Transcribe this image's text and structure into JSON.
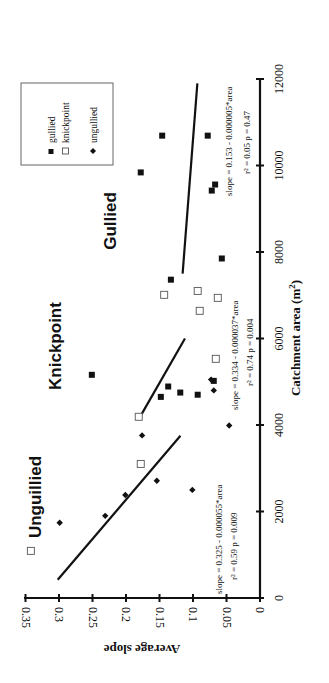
{
  "chart_data": {
    "type": "scatter",
    "orientation": "rotated 90 degrees counter-clockwise",
    "title": "",
    "xlabel": "Catchment area (m2)",
    "ylabel": "Average slope",
    "xlim": [
      0,
      12000
    ],
    "ylim": [
      0,
      0.35
    ],
    "x_ticks": [
      0,
      2000,
      4000,
      6000,
      8000,
      10000,
      12000
    ],
    "y_ticks": [
      0,
      0.05,
      0.1,
      0.15,
      0.2,
      0.25,
      0.3,
      0.35
    ],
    "y_tick_labels": [
      "0",
      "0.05",
      "0.1",
      "0.15",
      "0.2",
      "0.25",
      "0.3",
      "0.35"
    ],
    "grid": false,
    "legend_position": "upper left (top of rotated image)",
    "series": [
      {
        "name": "gullied",
        "marker": "filled-square",
        "points": [
          {
            "x": 10690,
            "y": 0.146
          },
          {
            "x": 10690,
            "y": 0.078
          },
          {
            "x": 9840,
            "y": 0.178
          },
          {
            "x": 9560,
            "y": 0.067
          },
          {
            "x": 9420,
            "y": 0.072
          },
          {
            "x": 7850,
            "y": 0.057
          },
          {
            "x": 7360,
            "y": 0.133
          },
          {
            "x": 5160,
            "y": 0.251
          },
          {
            "x": 5020,
            "y": 0.069
          },
          {
            "x": 4890,
            "y": 0.137
          },
          {
            "x": 4750,
            "y": 0.119
          },
          {
            "x": 4700,
            "y": 0.093
          },
          {
            "x": 4650,
            "y": 0.148
          }
        ]
      },
      {
        "name": "knickpoint",
        "marker": "open-square",
        "points": [
          {
            "x": 7100,
            "y": 0.093
          },
          {
            "x": 7010,
            "y": 0.143
          },
          {
            "x": 6940,
            "y": 0.063
          },
          {
            "x": 6640,
            "y": 0.09
          },
          {
            "x": 5530,
            "y": 0.066
          },
          {
            "x": 4190,
            "y": 0.181
          },
          {
            "x": 3100,
            "y": 0.178
          },
          {
            "x": 1090,
            "y": 0.342
          }
        ]
      },
      {
        "name": "ungullied",
        "marker": "diamond",
        "points": [
          {
            "x": 5050,
            "y": 0.073
          },
          {
            "x": 4800,
            "y": 0.069
          },
          {
            "x": 3990,
            "y": 0.046
          },
          {
            "x": 3760,
            "y": 0.176
          },
          {
            "x": 2710,
            "y": 0.154
          },
          {
            "x": 2500,
            "y": 0.101
          },
          {
            "x": 2380,
            "y": 0.201
          },
          {
            "x": 1900,
            "y": 0.231
          },
          {
            "x": 1740,
            "y": 0.299
          }
        ]
      }
    ],
    "fit_lines": [
      {
        "group": "ungullied",
        "intercept": 0.325,
        "coef": -5.5e-05,
        "x_range": [
          420,
          3750
        ]
      },
      {
        "group": "knickpoint",
        "intercept": 0.334,
        "coef": -3.7e-05,
        "x_range": [
          4200,
          6000
        ]
      },
      {
        "group": "gullied",
        "intercept": 0.153,
        "coef": -5e-06,
        "x_range": [
          7500,
          11900
        ]
      }
    ],
    "annotations": [
      {
        "text": "slope = 0.325 - 0.000055*area",
        "text2": "r² = 0.59  p = 0.009"
      },
      {
        "text": "slope = 0.334 - 0.000037*area",
        "text2": "r² = 0.74  p = 0.004"
      },
      {
        "text": "slope = 0.153 - 0.000005*area",
        "text2": "r² = 0.05  p = 0.47"
      }
    ],
    "region_labels": [
      "Unguillied",
      "Knickpoint",
      "Gullied"
    ]
  },
  "labels": {
    "x_axis_title": "Catchment area (m",
    "x_axis_sup": "2",
    "x_axis_close": ")",
    "y_axis_title": "Average slope",
    "x_ticks": [
      "0",
      "2000",
      "4000",
      "6000",
      "8000",
      "10000",
      "12000"
    ],
    "y_ticks": [
      "0",
      "0.05",
      "0.1",
      "0.15",
      "0.2",
      "0.25",
      "0.3",
      "0.35"
    ],
    "region_ungullied": "Unguillied",
    "region_knickpoint": "Knickpoint",
    "region_gullied": "Gullied",
    "eq_ungullied": "slope = 0.325 - 0.000055*area",
    "stat_ungullied": "r² = 0.59  p = 0.009",
    "eq_knickpoint": "slope = 0.334 - 0.000037*area",
    "stat_knickpoint": "r² = 0.74  p = 0.004",
    "eq_gullied": "slope = 0.153 - 0.000005*area",
    "stat_gullied": "r² = 0.05  p = 0.47",
    "legend": [
      "gullied",
      "knickpoint",
      "ungullied"
    ]
  },
  "colors": {
    "ink": "#111111",
    "background": "#ffffff",
    "open_marker_stroke": "#555555"
  }
}
